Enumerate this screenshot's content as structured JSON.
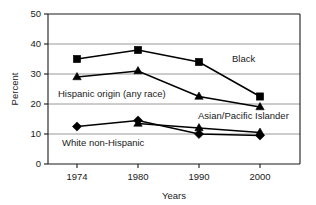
{
  "chart_data": {
    "type": "line",
    "title": "",
    "xlabel": "Years",
    "ylabel": "Percent",
    "categories": [
      "1974",
      "1980",
      "1990",
      "2000"
    ],
    "x": [
      1974,
      1980,
      1990,
      2000
    ],
    "ylim": [
      0,
      50
    ],
    "yticks": [
      "0",
      "10",
      "20",
      "30",
      "40",
      "50"
    ],
    "ytick_values": [
      0,
      10,
      20,
      30,
      40,
      50
    ],
    "grid": "horizontal",
    "legend": "inline-annotations",
    "series": [
      {
        "name": "Black",
        "marker": "square",
        "values": [
          35,
          38,
          34,
          22.5
        ],
        "label_text": "Black"
      },
      {
        "name": "Hispanic origin (any race)",
        "marker": "triangle",
        "values": [
          29,
          31,
          22.5,
          19
        ],
        "label_text": "Hispanic origin (any race)"
      },
      {
        "name": "Asian/Pacific Islander",
        "marker": "triangle",
        "values": [
          null,
          13.5,
          12,
          10.5
        ],
        "label_text": "Asian/Pacific Islander"
      },
      {
        "name": "White non-Hispanic",
        "marker": "diamond",
        "values": [
          12.5,
          14.5,
          10,
          9.5
        ],
        "label_text": "White non-Hispanic"
      }
    ],
    "annotations": [
      {
        "text": "Black",
        "x": 232,
        "y": 62
      },
      {
        "text": "Hispanic origin (any race)",
        "x": 58,
        "y": 97
      },
      {
        "text": "Asian/Pacific Islander",
        "x": 198,
        "y": 119
      },
      {
        "text": "White non-Hispanic",
        "x": 62,
        "y": 146
      }
    ],
    "colors": {
      "line": "#000000",
      "marker": "#000000",
      "grid": "#8c8c8c",
      "axis": "#1a1a1a",
      "background": "#ffffff"
    }
  }
}
